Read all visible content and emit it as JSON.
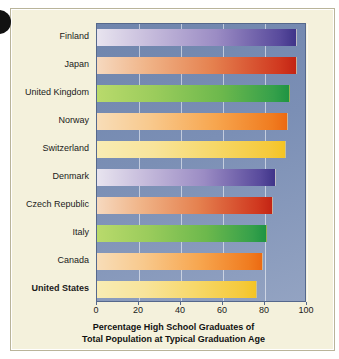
{
  "chart_data": {
    "type": "bar",
    "orientation": "horizontal",
    "title": "",
    "caption_line1": "Percentage High School Graduates of",
    "caption_line2": "Total Population at Typical Graduation Age",
    "xlabel": "",
    "ylabel": "",
    "xlim": [
      0,
      100
    ],
    "xticks": [
      0,
      20,
      40,
      60,
      80,
      100
    ],
    "xtick_labels": [
      "0",
      "20",
      "40",
      "60",
      "80",
      "100"
    ],
    "grid": true,
    "grid_axis": "x",
    "legend": false,
    "categories": [
      "Finland",
      "Japan",
      "United Kingdom",
      "Norway",
      "Switzerland",
      "Denmark",
      "Czech Republic",
      "Italy",
      "Canada",
      "United States"
    ],
    "values": [
      95,
      95,
      92,
      91,
      90,
      85,
      84,
      81,
      79,
      76
    ],
    "bar_colors": [
      "#3f3489",
      "#c32414",
      "#1f9443",
      "#ec6a12",
      "#f4c424",
      "#3f3489",
      "#c32414",
      "#1f9443",
      "#ec6a12",
      "#f4c424"
    ],
    "bar_palettes": [
      "pal-purple",
      "pal-red",
      "pal-green",
      "pal-orange",
      "pal-yellow",
      "pal-purple",
      "pal-red",
      "pal-green",
      "pal-orange",
      "pal-yellow"
    ],
    "emphasized_category": "United States",
    "plot_background": "#7b8fb5",
    "page_background": "#f4f1dc"
  }
}
